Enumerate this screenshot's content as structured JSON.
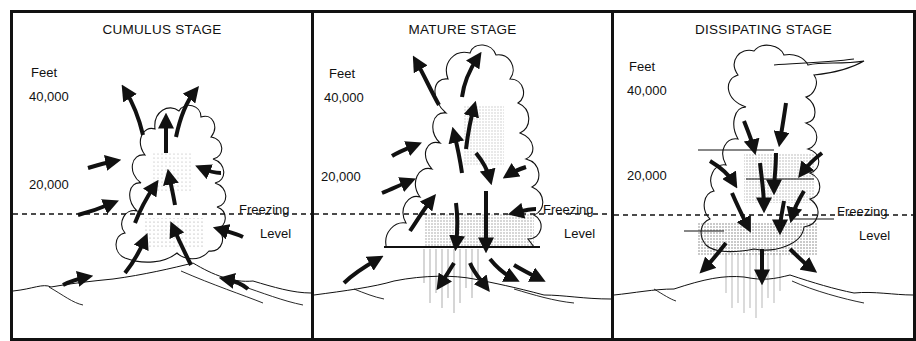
{
  "figure": {
    "panels": [
      {
        "title": "CUMULUS STAGE",
        "axis_unit": "Feet",
        "altitude_labels": [
          "40,000",
          "20,000"
        ],
        "freezing_label_line1": "Freezing",
        "freezing_label_line2": "Level",
        "airflow": "updrafts"
      },
      {
        "title": "MATURE STAGE",
        "axis_unit": "Feet",
        "altitude_labels": [
          "40,000",
          "20,000"
        ],
        "freezing_label_line1": "Freezing",
        "freezing_label_line2": "Level",
        "airflow": "updrafts and downdrafts with precipitation"
      },
      {
        "title": "DISSIPATING STAGE",
        "axis_unit": "Feet",
        "altitude_labels": [
          "40,000",
          "20,000"
        ],
        "freezing_label_line1": "Freezing",
        "freezing_label_line2": "Level",
        "airflow": "downdrafts"
      }
    ],
    "colors": {
      "ink": "#111111",
      "background": "#ffffff",
      "stipple": "#555555"
    }
  }
}
